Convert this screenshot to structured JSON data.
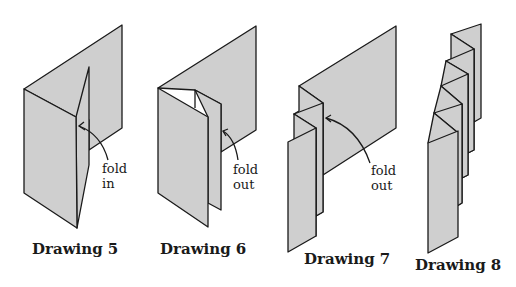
{
  "figures": [
    {
      "caption": "Drawing 5",
      "annotation": {
        "line1": "fold",
        "line2": "in"
      }
    },
    {
      "caption": "Drawing 6",
      "annotation": {
        "line1": "fold",
        "line2": "out"
      }
    },
    {
      "caption": "Drawing 7",
      "annotation": {
        "line1": "fold",
        "line2": "out"
      }
    },
    {
      "caption": "Drawing 8"
    }
  ],
  "colors": {
    "paper_fill": "#cfcfcf",
    "outline": "#1a1a1a",
    "background": "#ffffff"
  }
}
